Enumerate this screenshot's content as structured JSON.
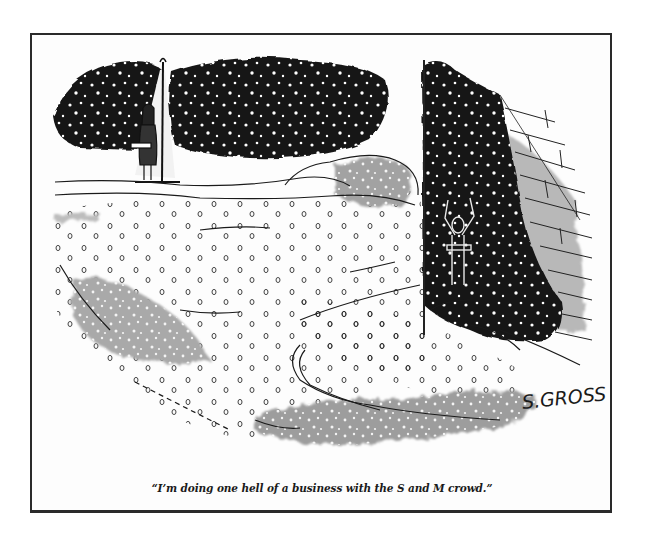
{
  "cartoon": {
    "caption": "“I’m doing one hell of a business with the S and M crowd.”",
    "signature": "S.GROSS",
    "scene": {
      "left_figure": "vendor standing under lamp post with tray",
      "right_figure": "figure with raised arms in dark doorway with tray",
      "setting": "snowy night street with brick wall"
    },
    "colors": {
      "ink": "#1a1a1a",
      "wash_gray": "#9a9a9a",
      "paper": "#fdfdfd",
      "frame": "#2a2a2a"
    }
  }
}
